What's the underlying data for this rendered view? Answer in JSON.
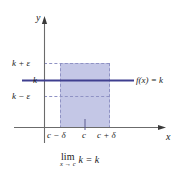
{
  "figure": {
    "axes": {
      "y_label": "y",
      "x_label": "x"
    },
    "y_ticks": [
      {
        "id": "k-plus-eps",
        "label": "k + ε"
      },
      {
        "id": "k",
        "label": "k"
      },
      {
        "id": "k-minus-eps",
        "label": "k − ε"
      }
    ],
    "x_ticks": [
      {
        "id": "c-minus-delta",
        "label": "c − δ"
      },
      {
        "id": "c",
        "label": "c"
      },
      {
        "id": "c-plus-delta",
        "label": "c + δ"
      }
    ],
    "function_label": "f(x) = k",
    "caption": {
      "lim": "lim",
      "subscript": "x → c",
      "expression": "k = k"
    },
    "colors": {
      "line": "#3f3f8f",
      "fill": "#c4c7e6",
      "dash": "#8f92c4",
      "axis": "#6b6b6b",
      "text": "#1a1a1a",
      "background": "#ffffff"
    }
  }
}
